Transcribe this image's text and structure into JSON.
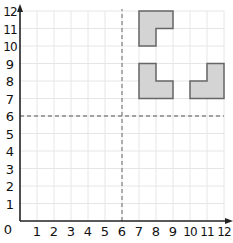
{
  "grid": {
    "x_min": 0,
    "x_max": 12,
    "y_min": 0,
    "y_max": 12,
    "origin_label": "0",
    "x_ticks": [
      "1",
      "2",
      "3",
      "4",
      "5",
      "6",
      "7",
      "8",
      "9",
      "10",
      "11",
      "12"
    ],
    "y_ticks": [
      "1",
      "2",
      "3",
      "4",
      "5",
      "6",
      "7",
      "8",
      "9",
      "10",
      "11",
      "12"
    ],
    "grid_color": "#e6e6e6",
    "axis_color": "#222222",
    "dashed_lines": {
      "x": 6,
      "y": 6,
      "color": "#888888"
    }
  },
  "shapes": [
    {
      "name": "l-shape-top",
      "points": [
        [
          7,
          12
        ],
        [
          9,
          12
        ],
        [
          9,
          11
        ],
        [
          8,
          11
        ],
        [
          8,
          10
        ],
        [
          7,
          10
        ]
      ]
    },
    {
      "name": "l-shape-bottom-left",
      "points": [
        [
          7,
          9
        ],
        [
          8,
          9
        ],
        [
          8,
          8
        ],
        [
          9,
          8
        ],
        [
          9,
          7
        ],
        [
          7,
          7
        ]
      ]
    },
    {
      "name": "l-shape-bottom-right",
      "points": [
        [
          11,
          9
        ],
        [
          12,
          9
        ],
        [
          12,
          7
        ],
        [
          10,
          7
        ],
        [
          10,
          8
        ],
        [
          11,
          8
        ]
      ]
    }
  ],
  "shape_fill": "#d4d4d4",
  "shape_stroke": "#666666"
}
